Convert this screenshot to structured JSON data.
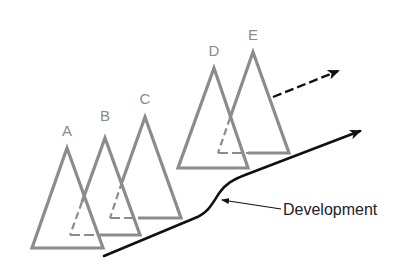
{
  "diagram": {
    "colors": {
      "triangle_stroke": "#8c8c8c",
      "arrow_stroke": "#111111",
      "label_gray": "#8a8a8a",
      "label_dark": "#222222",
      "background": "#ffffff"
    },
    "triangles": [
      {
        "label": "A",
        "apex": [
          67,
          148
        ],
        "base_left": [
          32,
          248
        ],
        "base_right": [
          103,
          248
        ],
        "hidden_parts": false
      },
      {
        "label": "B",
        "apex": [
          105,
          138
        ],
        "base_left": [
          70,
          235
        ],
        "base_right": [
          140,
          235
        ],
        "hidden_parts": true
      },
      {
        "label": "C",
        "apex": [
          145,
          117
        ],
        "base_left": [
          110,
          218
        ],
        "base_right": [
          181,
          218
        ],
        "hidden_parts": true
      },
      {
        "label": "D",
        "apex": [
          214,
          68
        ],
        "base_left": [
          178,
          168
        ],
        "base_right": [
          248,
          168
        ],
        "hidden_parts": false
      },
      {
        "label": "E",
        "apex": [
          253,
          52
        ],
        "base_left": [
          218,
          153
        ],
        "base_right": [
          289,
          153
        ],
        "hidden_parts": true
      }
    ],
    "development_label": "Development",
    "arrows": {
      "dashed": {
        "from": [
          273,
          97
        ],
        "to": [
          340,
          70
        ],
        "style": "dashed"
      },
      "development_curve": {
        "style": "solid"
      }
    }
  }
}
